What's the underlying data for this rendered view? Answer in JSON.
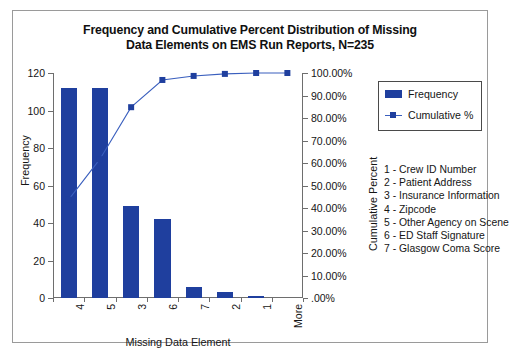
{
  "chart_data": {
    "type": "bar",
    "title": "Frequency and Cumulative Percent Distribution of Missing Data Elements on EMS Run Reports, N=235",
    "title_line1": "Frequency and Cumulative Percent Distribution of Missing",
    "title_line2": "Data Elements on EMS Run Reports, N=235",
    "xlabel": "Missing Data Element",
    "ylabel": "Frequency",
    "y2label": "Cumulative Percent",
    "categories": [
      "4",
      "5",
      "3",
      "6",
      "7",
      "2",
      "1",
      "More"
    ],
    "series": [
      {
        "name": "Frequency",
        "type": "bar",
        "axis": "left",
        "color": "#1f3f9e",
        "values": [
          112,
          112,
          49,
          42,
          6,
          3,
          1,
          0
        ]
      },
      {
        "name": "Cumulative %",
        "type": "line",
        "axis": "right",
        "color": "#3a5fbe",
        "marker_color": "#1f3f9e",
        "values": [
          43.7,
          61.7,
          84.8,
          96.9,
          98.7,
          99.6,
          100.0,
          100.0
        ]
      }
    ],
    "ylim": [
      0,
      120
    ],
    "yticks": [
      0,
      20,
      40,
      60,
      80,
      100,
      120
    ],
    "ytick_labels": [
      "0",
      "20",
      "40",
      "60",
      "80",
      "100",
      "120"
    ],
    "y2lim": [
      0,
      100
    ],
    "y2ticks": [
      0,
      10,
      20,
      30,
      40,
      50,
      60,
      70,
      80,
      90,
      100
    ],
    "y2tick_labels": [
      ".00%",
      "10.00%",
      "20.00%",
      "30.00%",
      "40.00%",
      "50.00%",
      "60.00%",
      "70.00%",
      "80.00%",
      "90.00%",
      "100.00%"
    ],
    "grid": false,
    "legend_position": "right"
  },
  "legend": {
    "items": [
      {
        "label": "Frequency",
        "icon": "bar-swatch"
      },
      {
        "label": "Cumulative %",
        "icon": "line-marker-swatch"
      }
    ]
  },
  "key": {
    "items": [
      "1 - Crew ID Number",
      "2 - Patient Address",
      "3 - Insurance Information",
      "4 - Zipcode",
      "5 - Other Agency on Scene",
      "6 - ED Staff Signature",
      "7 - Glasgow Coma Score"
    ]
  },
  "colors": {
    "bar": "#1f3f9e",
    "line": "#3a5fbe",
    "axis": "#6e6e6e",
    "border": "#9a9a9a",
    "text": "#151515"
  }
}
